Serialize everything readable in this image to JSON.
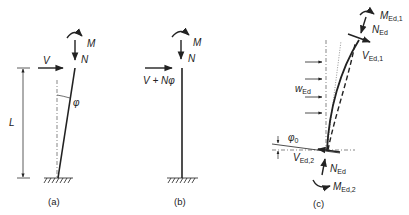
{
  "figure": {
    "colors": {
      "line": "#222222",
      "axis": "#555555",
      "background": "#ffffff"
    },
    "panel_a": {
      "caption": "(a)",
      "moment_label": "M",
      "axial_label": "N",
      "shear_label": "V",
      "length_label": "L",
      "angle_label": "φ"
    },
    "panel_b": {
      "caption": "(b)",
      "moment_label": "M",
      "axial_label": "N",
      "shear_label": "V + Nφ"
    },
    "panel_c": {
      "caption": "(c)",
      "top_moment": {
        "main": "M",
        "sub": "Ed,1"
      },
      "top_axial": {
        "main": "N",
        "sub": "Ed"
      },
      "top_shear": {
        "main": "V",
        "sub": "Ed,1"
      },
      "distributed_load": {
        "main": "w",
        "sub": "Ed"
      },
      "imperfection_angle": {
        "main": "φ",
        "sub": "0"
      },
      "base_shear": {
        "main": "V",
        "sub": "Ed,2"
      },
      "base_axial": {
        "main": "N",
        "sub": "Ed"
      },
      "base_moment": {
        "main": "M",
        "sub": "Ed,2"
      }
    }
  }
}
